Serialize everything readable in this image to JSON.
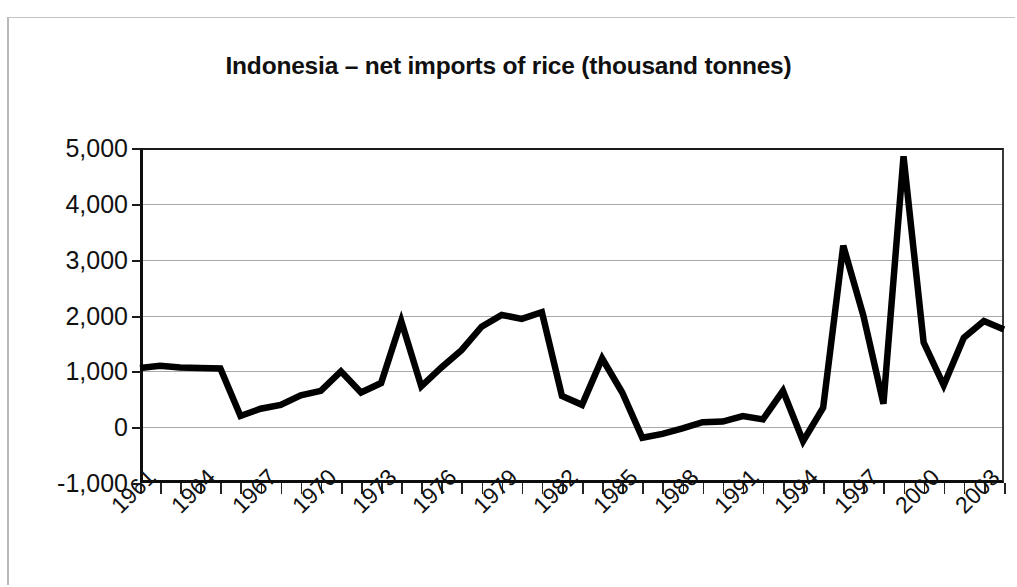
{
  "chart_data": {
    "type": "line",
    "title": "Indonesia – net imports of rice (thousand tonnes)",
    "xlabel": "",
    "ylabel": "",
    "ylim": [
      -1000,
      5000
    ],
    "ytick_labels": [
      "5,000",
      "4,000",
      "3,000",
      "2,000",
      "1,000",
      "0",
      "-1,000"
    ],
    "ytick_values": [
      5000,
      4000,
      3000,
      2000,
      1000,
      0,
      -1000
    ],
    "grid": true,
    "legend": "none",
    "line_color": "#000000",
    "xtick_labels": [
      "1961",
      "1964",
      "1967",
      "1970",
      "1973",
      "1976",
      "1979",
      "1982",
      "1985",
      "1988",
      "1991",
      "1994",
      "1997",
      "2000",
      "2003"
    ],
    "xtick_label_step": 3,
    "xlim": [
      1961,
      2004
    ],
    "x": [
      1961,
      1962,
      1963,
      1964,
      1965,
      1966,
      1967,
      1968,
      1969,
      1970,
      1971,
      1972,
      1973,
      1974,
      1975,
      1976,
      1977,
      1978,
      1979,
      1980,
      1981,
      1982,
      1983,
      1984,
      1985,
      1986,
      1987,
      1988,
      1989,
      1990,
      1991,
      1992,
      1993,
      1994,
      1995,
      1996,
      1997,
      1998,
      1999,
      2000,
      2001,
      2002,
      2003,
      2004
    ],
    "values": [
      1060,
      1100,
      1070,
      1060,
      1050,
      200,
      330,
      400,
      570,
      650,
      1000,
      620,
      790,
      1900,
      730,
      1070,
      1380,
      1800,
      2010,
      1940,
      2060,
      560,
      400,
      1230,
      620,
      -190,
      -120,
      -20,
      90,
      100,
      200,
      140,
      650,
      -250,
      350,
      3250,
      2000,
      420,
      4850,
      1520,
      750,
      1600,
      1900,
      1750
    ],
    "series_name": "net imports of rice"
  },
  "figure": {
    "title": "Indonesia – net imports of rice (thousand tonnes)"
  }
}
